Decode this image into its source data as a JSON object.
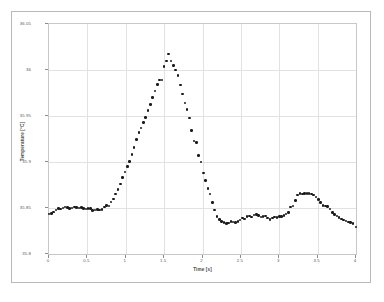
{
  "chart_data": {
    "type": "scatter",
    "title": "",
    "xlabel": "Time [s]",
    "ylabel": "Temperature [°C]",
    "xlim": [
      0,
      4
    ],
    "ylim": [
      35.8,
      36.05
    ],
    "grid": true,
    "legend": null,
    "marker": "filled-circle",
    "marker_color": "#1a1a1a",
    "xticks": [
      "0",
      "0.5",
      "1",
      "1.5",
      "2",
      "2.5",
      "3",
      "3.5",
      "4"
    ],
    "xtick_values": [
      0,
      0.5,
      1,
      1.5,
      2,
      2.5,
      3,
      3.5,
      4
    ],
    "yticks": [
      "35.8",
      "35.85",
      "35.9",
      "35.95",
      "36",
      "36.05"
    ],
    "ytick_values": [
      35.8,
      35.85,
      35.9,
      35.95,
      36.0,
      36.05
    ],
    "series": [
      {
        "name": "Temperature",
        "x": [
          0.0,
          0.03,
          0.06,
          0.09,
          0.12,
          0.15,
          0.18,
          0.21,
          0.24,
          0.27,
          0.3,
          0.33,
          0.36,
          0.39,
          0.42,
          0.45,
          0.48,
          0.51,
          0.54,
          0.57,
          0.6,
          0.63,
          0.66,
          0.69,
          0.72,
          0.75,
          0.78,
          0.81,
          0.84,
          0.87,
          0.9,
          0.93,
          0.96,
          0.99,
          1.02,
          1.05,
          1.08,
          1.11,
          1.14,
          1.17,
          1.2,
          1.23,
          1.26,
          1.29,
          1.32,
          1.35,
          1.38,
          1.41,
          1.44,
          1.47,
          1.5,
          1.53,
          1.56,
          1.59,
          1.62,
          1.65,
          1.68,
          1.71,
          1.74,
          1.77,
          1.8,
          1.83,
          1.86,
          1.89,
          1.92,
          1.95,
          1.98,
          2.01,
          2.04,
          2.07,
          2.1,
          2.13,
          2.16,
          2.19,
          2.22,
          2.25,
          2.28,
          2.31,
          2.34,
          2.37,
          2.4,
          2.43,
          2.46,
          2.49,
          2.52,
          2.55,
          2.58,
          2.61,
          2.64,
          2.67,
          2.7,
          2.73,
          2.76,
          2.79,
          2.82,
          2.85,
          2.88,
          2.91,
          2.94,
          2.97,
          3.0,
          3.03,
          3.06,
          3.09,
          3.12,
          3.15,
          3.18,
          3.21,
          3.24,
          3.27,
          3.3,
          3.33,
          3.36,
          3.39,
          3.42,
          3.45,
          3.48,
          3.51,
          3.54,
          3.57,
          3.6,
          3.63,
          3.66,
          3.69,
          3.72,
          3.75,
          3.78,
          3.81,
          3.84,
          3.87,
          3.9,
          3.93,
          3.96,
          4.0
        ],
        "y": [
          35.8437,
          35.844,
          35.8455,
          35.848,
          35.8495,
          35.849,
          35.8498,
          35.8512,
          35.8508,
          35.8495,
          35.8502,
          35.851,
          35.8505,
          35.8498,
          35.8505,
          35.8495,
          35.8488,
          35.8497,
          35.8492,
          35.847,
          35.8478,
          35.8482,
          35.848,
          35.8485,
          35.851,
          35.8525,
          35.852,
          35.8565,
          35.86,
          35.865,
          35.87,
          35.876,
          35.883,
          35.889,
          35.895,
          35.9005,
          35.908,
          35.916,
          35.9245,
          35.932,
          35.937,
          35.943,
          35.9485,
          35.956,
          35.9625,
          35.97,
          35.977,
          35.9845,
          35.989,
          35.989,
          36.004,
          36.01,
          36.0175,
          36.01,
          36.005,
          36.0,
          35.994,
          35.9835,
          35.974,
          35.964,
          35.957,
          35.948,
          35.934,
          35.923,
          35.921,
          35.907,
          35.9,
          35.888,
          35.88,
          35.871,
          35.865,
          35.856,
          35.848,
          35.841,
          35.8375,
          35.8355,
          35.8345,
          35.833,
          35.8338,
          35.8352,
          35.835,
          35.8345,
          35.8355,
          35.837,
          35.839,
          35.838,
          35.8405,
          35.8415,
          35.84,
          35.8425,
          35.843,
          35.842,
          35.84,
          35.8405,
          35.8415,
          35.839,
          35.8378,
          35.839,
          35.84,
          35.8398,
          35.8405,
          35.841,
          35.842,
          35.8435,
          35.845,
          35.851,
          35.852,
          35.858,
          35.864,
          35.8655,
          35.865,
          35.8658,
          35.866,
          35.8658,
          35.8652,
          35.864,
          35.862,
          35.859,
          35.856,
          35.8525,
          35.852,
          35.8518,
          35.849,
          35.845,
          35.843,
          35.8415,
          35.8395,
          35.838,
          35.837,
          35.8358,
          35.8348,
          35.834,
          35.833,
          35.8295
        ]
      }
    ]
  },
  "figure": {
    "caption": ""
  }
}
